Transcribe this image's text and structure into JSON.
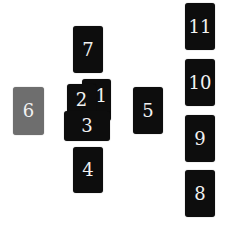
{
  "spread": {
    "title": "",
    "colors": {
      "card": "#0d0d0d",
      "highlight_card": "#6e6e6e",
      "text": "#f2f2f2",
      "background": "#ffffff"
    },
    "cards": [
      {
        "number": "1",
        "x": 82,
        "y": 79,
        "w": 29,
        "h": 42,
        "state": "normal",
        "z": 1,
        "label_offset": "right"
      },
      {
        "number": "2",
        "x": 67,
        "y": 84,
        "w": 29,
        "h": 30,
        "state": "normal",
        "z": 2
      },
      {
        "number": "3",
        "x": 64,
        "y": 111,
        "w": 46,
        "h": 30,
        "state": "normal",
        "z": 3
      },
      {
        "number": "4",
        "x": 73,
        "y": 147,
        "w": 30,
        "h": 46,
        "state": "normal",
        "z": 1
      },
      {
        "number": "5",
        "x": 133,
        "y": 87,
        "w": 30,
        "h": 47,
        "state": "normal",
        "z": 1
      },
      {
        "number": "6",
        "x": 13,
        "y": 87,
        "w": 31,
        "h": 48,
        "state": "highlighted",
        "z": 1
      },
      {
        "number": "7",
        "x": 73,
        "y": 26,
        "w": 30,
        "h": 47,
        "state": "normal",
        "z": 1
      },
      {
        "number": "8",
        "x": 185,
        "y": 170,
        "w": 30,
        "h": 47,
        "state": "normal",
        "z": 1
      },
      {
        "number": "9",
        "x": 185,
        "y": 115,
        "w": 30,
        "h": 47,
        "state": "normal",
        "z": 1
      },
      {
        "number": "10",
        "x": 185,
        "y": 59,
        "w": 30,
        "h": 47,
        "state": "normal",
        "z": 1
      },
      {
        "number": "11",
        "x": 185,
        "y": 3,
        "w": 30,
        "h": 47,
        "state": "normal",
        "z": 1
      }
    ]
  }
}
